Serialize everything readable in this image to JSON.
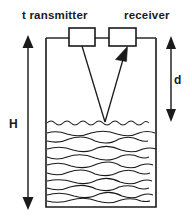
{
  "figure": {
    "background_color": "#ffffff",
    "stroke_color": "#1a1a1a",
    "labels": {
      "transmitter": "t ransmitter",
      "receiver": "receiver",
      "tank_height": "H",
      "distance_to_surface": "d"
    },
    "components": {
      "transmitter_box": {
        "name": "transmitter",
        "x": 69,
        "y": 28,
        "width": 26,
        "height": 18
      },
      "receiver_box": {
        "name": "receiver",
        "x": 109,
        "y": 28,
        "width": 27,
        "height": 18
      },
      "tank": {
        "x": 46,
        "y": 38,
        "width": 110,
        "height": 169
      },
      "liquid_surface_y": 123,
      "beam_reflection_point_x": 105
    },
    "dimension_arrows": [
      {
        "label": "H",
        "meaning": "total tank height",
        "x": 28,
        "y_top": 37,
        "y_bottom": 207,
        "label_x": 13,
        "label_y": 124
      },
      {
        "label": "d",
        "meaning": "distance from sensors to liquid surface",
        "x": 171,
        "y_top": 38,
        "y_bottom": 120,
        "label_x": 177,
        "label_y": 80
      }
    ],
    "liquid_waves": {
      "count": 11,
      "top_y": 123,
      "bottom_y": 203,
      "description": "wavy horizontal lines representing liquid body"
    }
  }
}
